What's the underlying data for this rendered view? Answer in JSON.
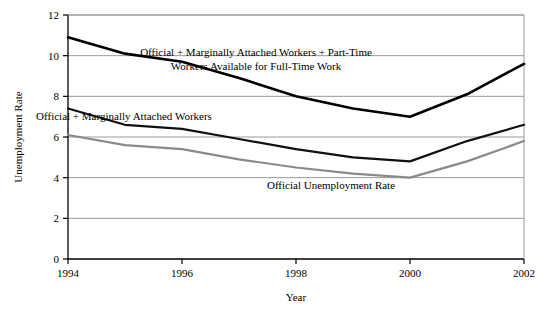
{
  "chart_data": {
    "type": "line",
    "title": "",
    "xlabel": "Year",
    "ylabel": "Unemployment Rate",
    "xlim": [
      1994,
      2002
    ],
    "ylim": [
      0,
      12
    ],
    "grid": true,
    "legend_position": "inline-annotations",
    "x": [
      1994,
      1995,
      1996,
      1997,
      1998,
      1999,
      2000,
      2001,
      2002
    ],
    "xticks": [
      1994,
      1996,
      1998,
      2000,
      2002
    ],
    "xtick_labels": [
      "1994",
      "1996",
      "1998",
      "2000",
      "2002"
    ],
    "yticks": [
      0,
      2,
      4,
      6,
      8,
      10,
      12
    ],
    "ytick_labels": [
      "0",
      "2",
      "4",
      "6",
      "8",
      "10",
      "12"
    ],
    "series": [
      {
        "name": "Official + Marginally Attached Workers + Part-Time Workers Available for Full-Time Work",
        "color": "#000000",
        "line_width": 2.6,
        "values": [
          10.9,
          10.1,
          9.7,
          8.9,
          8.0,
          7.4,
          7.0,
          8.1,
          9.6
        ]
      },
      {
        "name": "Official + Marginally Attached Workers",
        "color": "#111111",
        "line_width": 2.2,
        "values": [
          7.4,
          6.6,
          6.4,
          5.9,
          5.4,
          5.0,
          4.8,
          5.8,
          6.6
        ]
      },
      {
        "name": "Official Unemployment Rate",
        "color": "#8a8a8a",
        "line_width": 2.2,
        "values": [
          6.1,
          5.6,
          5.4,
          4.9,
          4.5,
          4.2,
          4.0,
          4.8,
          5.8
        ]
      }
    ],
    "annotations": [
      {
        "id": "annotation-top",
        "lines": [
          "Official + Marginally Attached Workers + Part-Time",
          "Workers Available for Full-Time Work"
        ],
        "x": 256,
        "y": 56
      },
      {
        "id": "annotation-middle",
        "lines": [
          "Official + Marginally Attached Workers"
        ],
        "x": 124,
        "y": 120
      },
      {
        "id": "annotation-bottom",
        "lines": [
          "Official Unemployment Rate"
        ],
        "x": 331,
        "y": 189
      }
    ]
  },
  "axes": {
    "y_title": "Unemployment Rate",
    "x_title": "Year"
  },
  "colors": {
    "background": "#ffffff",
    "axis": "#000000",
    "gridline": "#9a9a9a",
    "series_top": "#000000",
    "series_middle": "#111111",
    "series_bottom": "#8a8a8a"
  }
}
